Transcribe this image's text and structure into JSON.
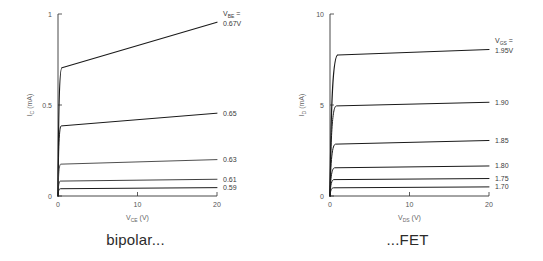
{
  "figure": {
    "background": "#ffffff",
    "ink": "#1a1a1a"
  },
  "panels": [
    {
      "id": "bipolar",
      "caption": "bipolar...",
      "legend_title": "V",
      "legend_title_sub": "BE",
      "legend_title_eq": "="
    },
    {
      "id": "fet",
      "caption": "...FET",
      "legend_title": "V",
      "legend_title_sub": "GS",
      "legend_title_eq": "="
    }
  ],
  "chart_data": [
    {
      "type": "line",
      "id": "bipolar-output-characteristics",
      "title": "bipolar...",
      "xlabel": "V_CE (V)",
      "xlabel_main": "V",
      "xlabel_sub": "CE",
      "xlabel_unit": "(V)",
      "ylabel": "I_C (mA)",
      "ylabel_main": "I",
      "ylabel_sub": "C",
      "ylabel_unit": "(mA)",
      "xlim": [
        0,
        20
      ],
      "ylim": [
        0,
        1
      ],
      "xticks": [
        0,
        10,
        20
      ],
      "xticklabels": [
        "0",
        "10",
        "20"
      ],
      "yticks": [
        0,
        0.5,
        1
      ],
      "yticklabels": [
        "0",
        "0.5",
        "1"
      ],
      "grid": false,
      "legend_position": "right-of-axes",
      "series": [
        {
          "name": "0.67V",
          "label": "0.67V",
          "knee_v": 0.5,
          "i_knee": 0.705,
          "i_at_20v": 0.955,
          "color": "#1a1a1a",
          "width": 1.15
        },
        {
          "name": "0.65",
          "label": "0.65",
          "knee_v": 0.4,
          "i_knee": 0.385,
          "i_at_20v": 0.455,
          "color": "#1a1a1a",
          "width": 1.0
        },
        {
          "name": "0.63",
          "label": "0.63",
          "knee_v": 0.35,
          "i_knee": 0.175,
          "i_at_20v": 0.2,
          "color": "#3b3b3b",
          "width": 0.9
        },
        {
          "name": "0.61",
          "label": "0.61",
          "knee_v": 0.3,
          "i_knee": 0.082,
          "i_at_20v": 0.092,
          "color": "#2a2a2a",
          "width": 0.9
        },
        {
          "name": "0.59",
          "label": "0.59",
          "knee_v": 0.3,
          "i_knee": 0.04,
          "i_at_20v": 0.046,
          "color": "#1a1a1a",
          "width": 1.0
        }
      ]
    },
    {
      "type": "line",
      "id": "fet-output-characteristics",
      "title": "...FET",
      "xlabel": "V_DS (V)",
      "xlabel_main": "V",
      "xlabel_sub": "DS",
      "xlabel_unit": "(V)",
      "ylabel": "I_D (mA)",
      "ylabel_main": "I",
      "ylabel_sub": "D",
      "ylabel_unit": "(mA)",
      "xlim": [
        0,
        20
      ],
      "ylim": [
        0,
        10
      ],
      "xticks": [
        0,
        10,
        20
      ],
      "xticklabels": [
        "0",
        "10",
        "20"
      ],
      "yticks": [
        0,
        5,
        10
      ],
      "yticklabels": [
        "0",
        "5",
        "10"
      ],
      "grid": false,
      "legend_position": "right-of-axes",
      "series": [
        {
          "name": "1.95V",
          "label": "1.95V",
          "knee_v": 1.0,
          "i_knee": 7.75,
          "i_at_20v": 8.05,
          "color": "#1a1a1a",
          "width": 1.15
        },
        {
          "name": "1.90",
          "label": "1.90",
          "knee_v": 0.8,
          "i_knee": 4.95,
          "i_at_20v": 5.15,
          "color": "#1a1a1a",
          "width": 1.0
        },
        {
          "name": "1.85",
          "label": "1.85",
          "knee_v": 0.7,
          "i_knee": 2.85,
          "i_at_20v": 3.05,
          "color": "#1a1a1a",
          "width": 1.0
        },
        {
          "name": "1.80",
          "label": "1.80",
          "knee_v": 0.6,
          "i_knee": 1.55,
          "i_at_20v": 1.65,
          "color": "#1a1a1a",
          "width": 1.0
        },
        {
          "name": "1.75",
          "label": "1.75",
          "knee_v": 0.5,
          "i_knee": 0.9,
          "i_at_20v": 0.96,
          "color": "#1a1a1a",
          "width": 1.0
        },
        {
          "name": "1.70",
          "label": "1.70",
          "knee_v": 0.45,
          "i_knee": 0.45,
          "i_at_20v": 0.5,
          "color": "#1a1a1a",
          "width": 1.0
        }
      ]
    }
  ]
}
